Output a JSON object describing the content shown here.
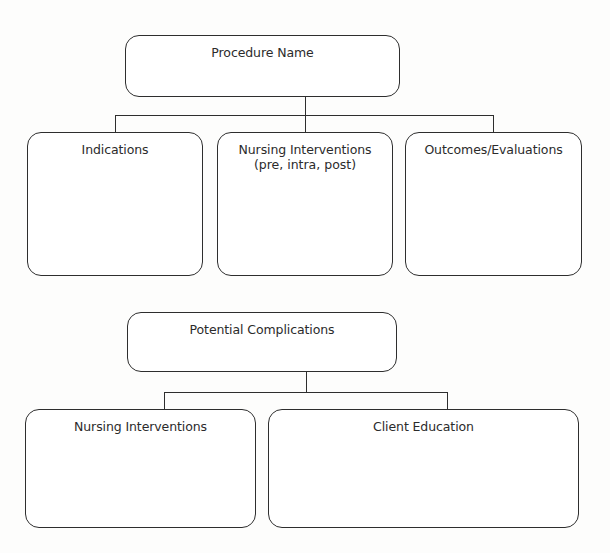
{
  "diagram": {
    "top": {
      "title": "Procedure Name",
      "children": [
        {
          "title": "Indications"
        },
        {
          "title": "Nursing Interventions",
          "subtitle": "(pre, intra, post)"
        },
        {
          "title": "Outcomes/Evaluations"
        }
      ]
    },
    "bottom": {
      "title": "Potential Complications",
      "children": [
        {
          "title": "Nursing Interventions"
        },
        {
          "title": "Client Education"
        }
      ]
    }
  },
  "colors": {
    "stroke": "#2e2e2e",
    "background": "#fdfdfc",
    "text": "#2b2b2b"
  }
}
